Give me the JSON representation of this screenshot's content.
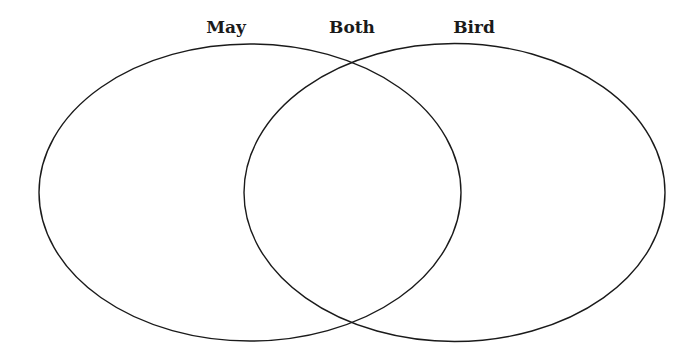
{
  "diagram": {
    "type": "venn",
    "labels": {
      "left": "May",
      "center": "Both",
      "right": "Bird"
    },
    "circles": [
      {
        "name": "May",
        "cx": 250,
        "cy": 192.5,
        "rx": 211,
        "ry": 148.5
      },
      {
        "name": "Bird",
        "cx": 454.5,
        "cy": 192.5,
        "rx": 210.5,
        "ry": 149
      }
    ],
    "stroke_color": "#1a1a1a"
  }
}
